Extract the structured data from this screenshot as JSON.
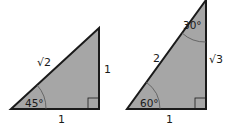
{
  "colors": {
    "fill": "#a6a6a6",
    "stroke": "#1a1a1a",
    "background": "#ffffff"
  },
  "triangles": [
    {
      "name": "45-45-90",
      "hypotenuse_label": "√2",
      "vertical_label": "1",
      "base_label": "1",
      "angle_label": "45°"
    },
    {
      "name": "30-60-90",
      "hypotenuse_label": "2",
      "vertical_label": "√3",
      "base_label": "1",
      "bottom_angle_label": "60°",
      "top_angle_label": "30°"
    }
  ]
}
